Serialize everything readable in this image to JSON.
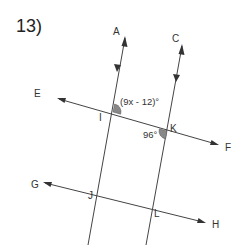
{
  "problem": {
    "number_label": "13)"
  },
  "diagram": {
    "type": "parallel lines cut by transversals",
    "points": {
      "A": "A",
      "C": "C",
      "E": "E",
      "F": "F",
      "G": "G",
      "H": "H",
      "I": "I",
      "J": "J",
      "K": "K",
      "L": "L"
    },
    "angles": {
      "angle_at_I": "(9x - 12)°",
      "angle_at_K": "96°"
    },
    "colors": {
      "line": "#444444",
      "angle_fill": "#888888",
      "text": "#333333"
    }
  }
}
